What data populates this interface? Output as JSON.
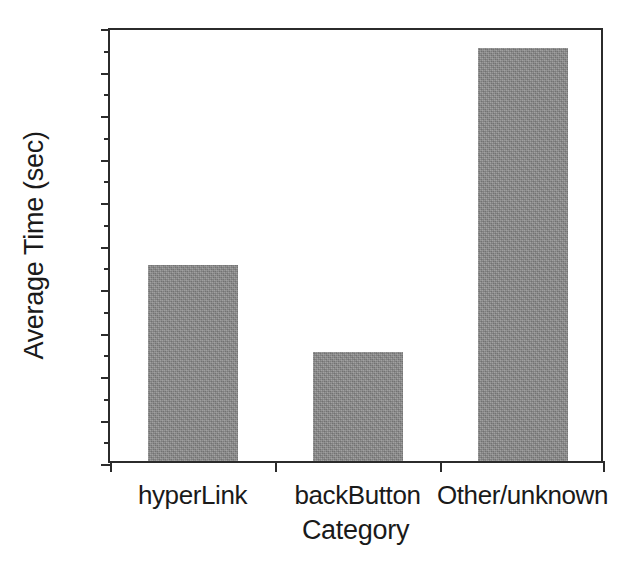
{
  "chart_data": {
    "type": "bar",
    "title": "",
    "subtitle": "",
    "categories": [
      "hyperLink",
      "backButton",
      "Other/unknown"
    ],
    "values": [
      9,
      5,
      19
    ],
    "series": [
      {
        "name": "Average Time",
        "values": [
          9,
          5,
          19
        ]
      }
    ],
    "xlabel": "Category",
    "ylabel": "Average Time (sec)",
    "ylim": [
      0,
      20
    ],
    "ytick_labels": [
      "0",
      "2",
      "4",
      "6",
      "8",
      "10",
      "12",
      "14",
      "16",
      "18",
      "20"
    ],
    "ytick_values": [
      0,
      2,
      4,
      6,
      8,
      10,
      12,
      14,
      16,
      18,
      20
    ],
    "yminor_values": [
      1,
      3,
      5,
      7,
      9,
      11,
      13,
      15,
      17,
      19
    ],
    "grid": false,
    "legend": null,
    "bar_color": "#8b8b8b",
    "axis_color": "#2b2b2b",
    "background_color": "#ffffff",
    "annotations": []
  }
}
